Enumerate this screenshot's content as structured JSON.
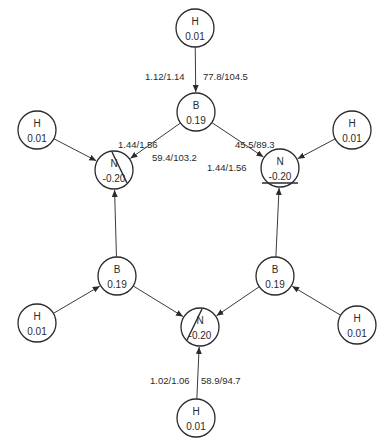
{
  "diagram": {
    "title": "",
    "colors": {
      "ink": "#2a2a2a",
      "background": "#ffffff"
    },
    "nodes": [
      {
        "id": "h_top",
        "element": "H",
        "charge": "0.01",
        "x": 195,
        "y": 28
      },
      {
        "id": "b_top",
        "element": "B",
        "charge": "0.19",
        "x": 196,
        "y": 112
      },
      {
        "id": "n_left",
        "element": "N",
        "charge": "-0.20",
        "x": 114,
        "y": 170,
        "mark": "diag-right"
      },
      {
        "id": "n_right",
        "element": "N",
        "charge": "-0.20",
        "x": 280,
        "y": 168,
        "mark": "underline"
      },
      {
        "id": "h_ul",
        "element": "H",
        "charge": "0.01",
        "x": 37,
        "y": 130
      },
      {
        "id": "h_ur",
        "element": "H",
        "charge": "0.01",
        "x": 352,
        "y": 130
      },
      {
        "id": "b_left",
        "element": "B",
        "charge": "0.19",
        "x": 117,
        "y": 276
      },
      {
        "id": "b_right",
        "element": "B",
        "charge": "0.19",
        "x": 275,
        "y": 276
      },
      {
        "id": "n_bottom",
        "element": "N",
        "charge": "-0.20",
        "x": 200,
        "y": 327,
        "mark": "diag-left"
      },
      {
        "id": "h_ll",
        "element": "H",
        "charge": "0.01",
        "x": 37,
        "y": 323
      },
      {
        "id": "h_lr",
        "element": "H",
        "charge": "0.01",
        "x": 357,
        "y": 325
      },
      {
        "id": "h_bottom",
        "element": "H",
        "charge": "0.01",
        "x": 196,
        "y": 418
      }
    ],
    "edges": [
      {
        "from": "h_top",
        "to": "b_top"
      },
      {
        "from": "b_top",
        "to": "n_left"
      },
      {
        "from": "b_top",
        "to": "n_right"
      },
      {
        "from": "h_ul",
        "to": "n_left"
      },
      {
        "from": "h_ur",
        "to": "n_right"
      },
      {
        "from": "b_left",
        "to": "n_left"
      },
      {
        "from": "b_right",
        "to": "n_right"
      },
      {
        "from": "b_left",
        "to": "n_bottom"
      },
      {
        "from": "b_right",
        "to": "n_bottom"
      },
      {
        "from": "h_ll",
        "to": "b_left"
      },
      {
        "from": "h_lr",
        "to": "b_right"
      },
      {
        "from": "h_bottom",
        "to": "n_bottom"
      }
    ],
    "bond_labels": [
      {
        "id": "bh_top_order",
        "text": "1.12/1.14",
        "x": 145,
        "y": 80
      },
      {
        "id": "bh_top_energy",
        "text": "77.8/104.5",
        "x": 203,
        "y": 80
      },
      {
        "id": "bn_left_order",
        "text": "1.44/1.56",
        "x": 118,
        "y": 148
      },
      {
        "id": "bn_left_energy",
        "text": "59.4/103.2",
        "x": 152,
        "y": 161
      },
      {
        "id": "bn_right_energy",
        "text": "45.5/89.3",
        "x": 235,
        "y": 148
      },
      {
        "id": "bn_right_order",
        "text": "1.44/1.56",
        "x": 207,
        "y": 171
      },
      {
        "id": "nh_bottom_order",
        "text": "1.02/1.06",
        "x": 150,
        "y": 384
      },
      {
        "id": "nh_bottom_energy",
        "text": "58.9/94.7",
        "x": 201,
        "y": 384
      }
    ]
  }
}
